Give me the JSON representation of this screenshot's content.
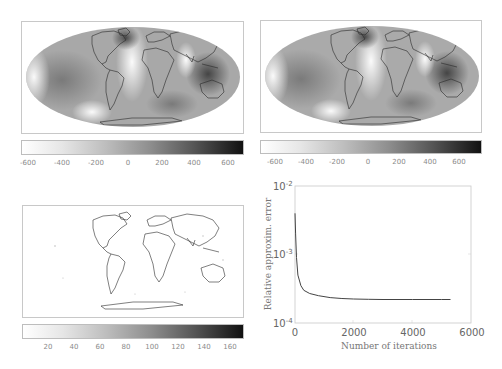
{
  "chart_data": [
    {
      "type": "heatmap",
      "title": "",
      "description": "Mollweide world map, grayscale field with coastlines",
      "colorbar": {
        "ticks": [
          "-600",
          "-400",
          "-200",
          "0",
          "200",
          "400",
          "600"
        ],
        "range": [
          -650,
          700
        ],
        "colormap": "gray_r"
      }
    },
    {
      "type": "heatmap",
      "title": "",
      "description": "Mollweide world map, grayscale field with coastlines (approximation)",
      "colorbar": {
        "ticks": [
          "-600",
          "-400",
          "-200",
          "0",
          "200",
          "400",
          "600"
        ],
        "range": [
          -650,
          700
        ],
        "colormap": "gray_r"
      }
    },
    {
      "type": "heatmap",
      "title": "",
      "description": "Mollweide world map, mostly white error field with coastlines",
      "colorbar": {
        "ticks": [
          "20",
          "40",
          "60",
          "80",
          "100",
          "120",
          "140",
          "160"
        ],
        "range": [
          10,
          170
        ],
        "colormap": "gray_r"
      }
    },
    {
      "type": "line",
      "title": "",
      "xlabel": "Number of iterations",
      "ylabel": "Relative approxim. error",
      "xlim": [
        0,
        6000
      ],
      "ylim": [
        0.0001,
        0.01
      ],
      "yscale": "log",
      "xticks": [
        "0",
        "2000",
        "4000",
        "6000"
      ],
      "yticks": [
        "10^-4",
        "10^-3",
        "10^-2"
      ],
      "grid": false,
      "series": [
        {
          "name": "error",
          "x": [
            0,
            20,
            50,
            100,
            200,
            300,
            500,
            800,
            1200,
            1600,
            2000,
            2500,
            3000,
            4000,
            5000,
            5300
          ],
          "y": [
            0.004,
            0.002,
            0.0009,
            0.0005,
            0.00035,
            0.0003,
            0.00027,
            0.00025,
            0.000235,
            0.000228,
            0.000224,
            0.000222,
            0.00022,
            0.00022,
            0.00022,
            0.00022
          ]
        }
      ]
    }
  ],
  "panels": {
    "top_left": {
      "cbar_ticks": [
        {
          "label": "-600",
          "x": 28
        },
        {
          "label": "-400",
          "x": 62
        },
        {
          "label": "-200",
          "x": 96
        },
        {
          "label": "0",
          "x": 128
        },
        {
          "label": "200",
          "x": 162
        },
        {
          "label": "400",
          "x": 194
        },
        {
          "label": "600",
          "x": 228
        }
      ]
    },
    "top_right": {
      "cbar_ticks": [
        {
          "label": "-600",
          "x": 275
        },
        {
          "label": "-400",
          "x": 306
        },
        {
          "label": "-200",
          "x": 337
        },
        {
          "label": "0",
          "x": 368
        },
        {
          "label": "200",
          "x": 399
        },
        {
          "label": "400",
          "x": 430
        },
        {
          "label": "600",
          "x": 459
        }
      ]
    },
    "bottom_left": {
      "cbar_ticks": [
        {
          "label": "20",
          "x": 48
        },
        {
          "label": "40",
          "x": 74
        },
        {
          "label": "60",
          "x": 100
        },
        {
          "label": "80",
          "x": 126
        },
        {
          "label": "100",
          "x": 152
        },
        {
          "label": "120",
          "x": 178
        },
        {
          "label": "140",
          "x": 204
        },
        {
          "label": "160",
          "x": 230
        }
      ]
    },
    "bottom_right": {
      "xlabel": "Number of iterations",
      "ylabel": "Relative approxim. error",
      "xticks": [
        "0",
        "2000",
        "4000",
        "6000"
      ],
      "yticks_base": [
        "10",
        "10",
        "10"
      ],
      "yticks_exp": [
        "-2",
        "-3",
        "-4"
      ]
    }
  }
}
